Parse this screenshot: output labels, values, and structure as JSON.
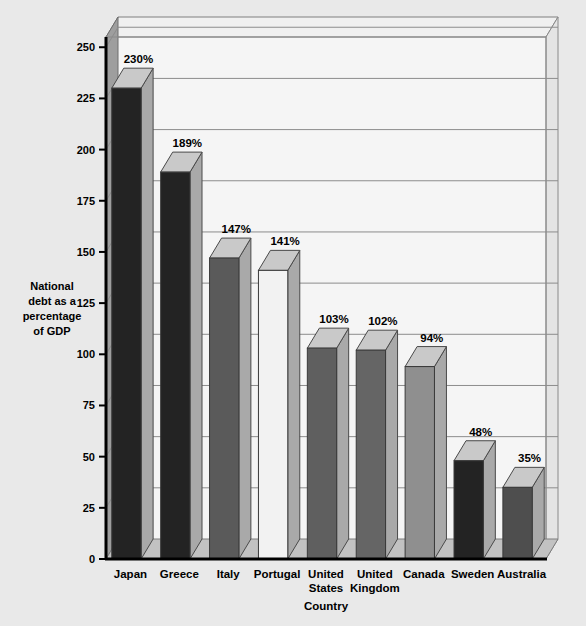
{
  "chart_data": {
    "type": "bar",
    "title": "",
    "xlabel": "Country",
    "ylabel": "National debt as a percentage of GDP",
    "ylabel_lines": [
      "National",
      "debt as a",
      "percentage",
      "of  GDP"
    ],
    "categories": [
      "Japan",
      "Greece",
      "Italy",
      "Portugal",
      "United States",
      "United Kingdom",
      "Canada",
      "Sweden",
      "Australia"
    ],
    "category_label_lines": [
      [
        "Japan"
      ],
      [
        "Greece"
      ],
      [
        "Italy"
      ],
      [
        "Portugal"
      ],
      [
        "United",
        "States"
      ],
      [
        "United",
        "Kingdom"
      ],
      [
        "Canada"
      ],
      [
        "Sweden"
      ],
      [
        "Australia"
      ]
    ],
    "values": [
      230,
      189,
      147,
      141,
      103,
      102,
      94,
      48,
      35
    ],
    "value_labels": [
      "230%",
      "189%",
      "147%",
      "141%",
      "103%",
      "102%",
      "94%",
      "48%",
      "35%"
    ],
    "bar_face_colors": [
      "#232323",
      "#232323",
      "#5a5a5a",
      "#f2f2f2",
      "#5f5f5f",
      "#656565",
      "#8f8f8f",
      "#232323",
      "#4e4e4e"
    ],
    "ylim": [
      0,
      255
    ],
    "yticks": [
      0,
      25,
      50,
      75,
      100,
      125,
      150,
      175,
      200,
      225,
      250
    ],
    "ytick_labels": [
      "0",
      "25",
      "50",
      "75",
      "100",
      "125",
      "150",
      "175",
      "200",
      "225",
      "250"
    ],
    "grid": true,
    "legend": "none",
    "style": "3d-bar"
  },
  "colors": {
    "page_background": "#e9e9e9",
    "plot_background": "#f5f5f5",
    "wall_side": "#9a9a9a",
    "grid_line": "#8c8c8c",
    "axis_line": "#000000",
    "bar_top": "#c9c9c9",
    "bar_side": "#a9a9a9",
    "floor": "#c2c2c2"
  },
  "ghost_text": {
    "title": "CAN UNCLE SAM GO BANKRUPT",
    "lines": [
      "Americans are worried that Washington is spending too much",
      "and that the national debt will soon overwhelm the economy.",
      "Is the United States really in danger of going broke?"
    ]
  }
}
